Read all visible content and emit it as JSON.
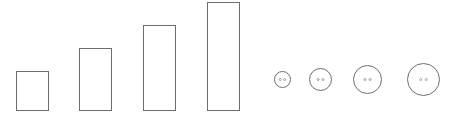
{
  "canvas": {
    "width": 454,
    "height": 120,
    "background": "#ffffff"
  },
  "style": {
    "stroke": "#6e6e6e",
    "hole_fill": "#8a8a8a"
  },
  "rectangles": [
    {
      "x": 16.5,
      "y": 71.5,
      "w": 32,
      "h": 39
    },
    {
      "x": 79.5,
      "y": 48.5,
      "w": 32,
      "h": 62
    },
    {
      "x": 143.5,
      "y": 25.5,
      "w": 32,
      "h": 85
    },
    {
      "x": 207.5,
      "y": 2.5,
      "w": 32,
      "h": 108
    }
  ],
  "buttons": [
    {
      "cx": 282.5,
      "cy": 79.5,
      "r": 8,
      "hole_dx": 2.2,
      "hole_r": 1
    },
    {
      "cx": 320.5,
      "cy": 79.5,
      "r": 11,
      "hole_dx": 2.4,
      "hole_r": 1
    },
    {
      "cx": 367.5,
      "cy": 79.5,
      "r": 14,
      "hole_dx": 2.6,
      "hole_r": 1
    },
    {
      "cx": 423.5,
      "cy": 79.5,
      "r": 16,
      "hole_dx": 2.8,
      "hole_r": 1
    }
  ]
}
